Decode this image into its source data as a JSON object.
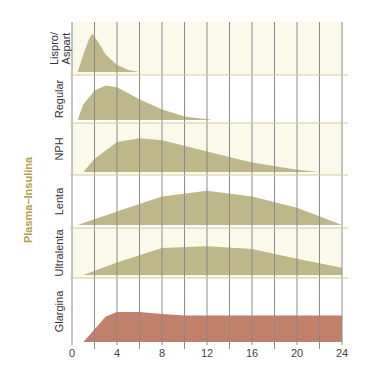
{
  "chart_data": {
    "type": "area",
    "title": "",
    "ylabel": "Plasma–Insulina",
    "xlabel": "",
    "x_ticks": [
      0,
      4,
      8,
      12,
      16,
      20,
      24
    ],
    "x_gridlines_every": 2,
    "xlim": [
      0,
      24
    ],
    "grid": true,
    "layout": "stacked-panels",
    "colors": {
      "fill_default": "#bdb78a",
      "fill_glargina": "#c0806a",
      "panel_cream": "#faf9ea",
      "panel_white": "#ffffff",
      "panel_divider": "#cfcc9a",
      "gridline": "#8a8a8a",
      "ylabel_color": "#b3a04a"
    },
    "series": [
      {
        "name": "Lispro/\nAspart",
        "label_lines": [
          "Lispro/",
          "Aspart"
        ],
        "color": "#bdb78a",
        "points": [
          [
            0.5,
            0
          ],
          [
            1,
            0.45
          ],
          [
            1.5,
            0.85
          ],
          [
            1.8,
            1.0
          ],
          [
            2.3,
            0.8
          ],
          [
            3,
            0.45
          ],
          [
            4,
            0.18
          ],
          [
            5,
            0.05
          ],
          [
            6,
            0
          ]
        ]
      },
      {
        "name": "Regular",
        "label_lines": [
          "Regular"
        ],
        "color": "#bdb78a",
        "points": [
          [
            0.5,
            0
          ],
          [
            1,
            0.45
          ],
          [
            2,
            0.85
          ],
          [
            3,
            1.0
          ],
          [
            4,
            0.95
          ],
          [
            6,
            0.6
          ],
          [
            8,
            0.3
          ],
          [
            10,
            0.1
          ],
          [
            12,
            0.02
          ],
          [
            12.5,
            0
          ]
        ]
      },
      {
        "name": "NPH",
        "label_lines": [
          "NPH"
        ],
        "color": "#bdb78a",
        "points": [
          [
            1,
            0
          ],
          [
            2,
            0.35
          ],
          [
            4,
            0.8
          ],
          [
            6,
            0.9
          ],
          [
            8,
            0.85
          ],
          [
            12,
            0.55
          ],
          [
            16,
            0.25
          ],
          [
            20,
            0.06
          ],
          [
            22,
            0
          ]
        ]
      },
      {
        "name": "Lenta",
        "label_lines": [
          "Lenta"
        ],
        "color": "#bdb78a",
        "points": [
          [
            0.5,
            0
          ],
          [
            4,
            0.35
          ],
          [
            8,
            0.75
          ],
          [
            12,
            0.9
          ],
          [
            16,
            0.75
          ],
          [
            20,
            0.45
          ],
          [
            24,
            0
          ]
        ]
      },
      {
        "name": "Ultralenta",
        "label_lines": [
          "Ultralenta"
        ],
        "color": "#bdb78a",
        "points": [
          [
            1,
            0
          ],
          [
            4,
            0.35
          ],
          [
            8,
            0.75
          ],
          [
            12,
            0.8
          ],
          [
            16,
            0.72
          ],
          [
            20,
            0.45
          ],
          [
            24,
            0.2
          ],
          [
            24,
            0
          ]
        ]
      },
      {
        "name": "Glargina",
        "label_lines": [
          "Glargina"
        ],
        "color": "#c0806a",
        "points": [
          [
            1,
            0
          ],
          [
            3,
            0.85
          ],
          [
            4,
            1.0
          ],
          [
            6,
            1.0
          ],
          [
            8,
            0.93
          ],
          [
            10,
            0.88
          ],
          [
            24,
            0.88
          ],
          [
            24,
            0
          ]
        ]
      }
    ]
  }
}
